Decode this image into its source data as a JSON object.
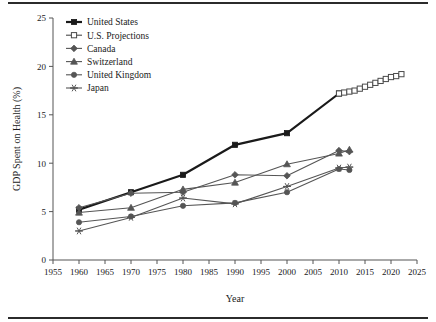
{
  "figure": {
    "has_top_rule": true,
    "has_bottom_rule": true
  },
  "chart_data": {
    "type": "line",
    "title": "",
    "xlabel": "Year",
    "ylabel": "GDP Spent on Health (%)",
    "xlim": [
      1955,
      2025
    ],
    "ylim": [
      0,
      25
    ],
    "xticks": [
      1955,
      1960,
      1965,
      1970,
      1975,
      1980,
      1985,
      1990,
      1995,
      2000,
      2005,
      2010,
      2015,
      2020,
      2025
    ],
    "yticks": [
      0,
      5,
      10,
      15,
      20,
      25
    ],
    "grid": false,
    "legend_position": "top-left",
    "series": [
      {
        "name": "United States",
        "marker": "filled-square",
        "color": "#1a1a1a",
        "linewidth": 2.2,
        "x": [
          1960,
          1970,
          1980,
          1990,
          2000,
          2010
        ],
        "values": [
          5.2,
          7.0,
          8.8,
          11.9,
          13.1,
          17.2
        ]
      },
      {
        "name": "U.S. Projections",
        "marker": "open-square",
        "color": "#4a4a4a",
        "linewidth": 1.1,
        "x": [
          2010,
          2011,
          2012,
          2013,
          2014,
          2015,
          2016,
          2017,
          2018,
          2019,
          2020,
          2021,
          2022
        ],
        "values": [
          17.2,
          17.3,
          17.4,
          17.5,
          17.7,
          17.9,
          18.1,
          18.3,
          18.5,
          18.7,
          18.9,
          19.0,
          19.2
        ]
      },
      {
        "name": "Canada",
        "marker": "diamond",
        "color": "#555555",
        "linewidth": 1.1,
        "x": [
          1960,
          1970,
          1980,
          1990,
          2000,
          2010,
          2012
        ],
        "values": [
          5.4,
          6.9,
          7.0,
          8.8,
          8.7,
          11.3,
          11.2
        ]
      },
      {
        "name": "Switzerland",
        "marker": "triangle",
        "color": "#555555",
        "linewidth": 1.1,
        "x": [
          1960,
          1970,
          1980,
          1990,
          2000,
          2010,
          2012
        ],
        "values": [
          4.9,
          5.4,
          7.3,
          8.0,
          9.9,
          11.0,
          11.4
        ]
      },
      {
        "name": "United Kingdom",
        "marker": "circle",
        "color": "#555555",
        "linewidth": 1.1,
        "x": [
          1960,
          1970,
          1980,
          1990,
          2000,
          2010,
          2012
        ],
        "values": [
          3.9,
          4.5,
          5.6,
          5.9,
          7.0,
          9.4,
          9.3
        ]
      },
      {
        "name": "Japan",
        "marker": "asterisk",
        "color": "#555555",
        "linewidth": 1.1,
        "x": [
          1960,
          1970,
          1980,
          1990,
          2000,
          2010,
          2012
        ],
        "values": [
          3.0,
          4.4,
          6.4,
          5.8,
          7.6,
          9.5,
          9.6
        ]
      }
    ]
  }
}
